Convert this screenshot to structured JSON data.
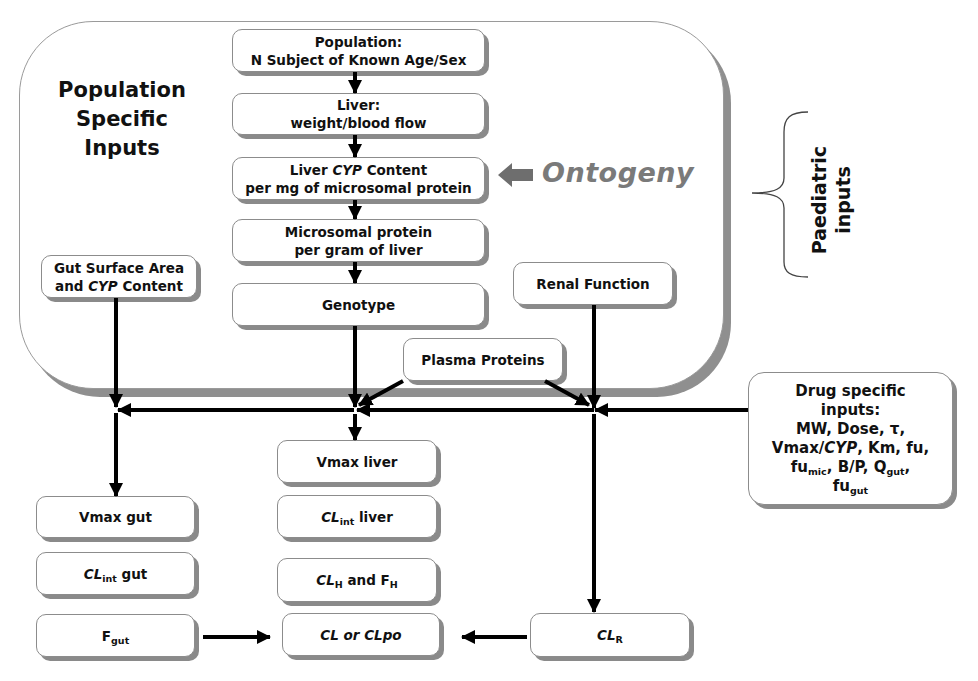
{
  "colors": {
    "box_border": "#8c8c8c",
    "box_shadow": "#8a8a8a",
    "arrow": "#000000",
    "ontogeny_text": "#7a7a7a",
    "ontogeny_arrow": "#6e6e6e"
  },
  "population_group": {
    "title_lines": [
      "Population",
      "Specific",
      "Inputs"
    ]
  },
  "central_column": {
    "population": {
      "lines": [
        "Population:",
        "N Subject of Known Age/Sex"
      ]
    },
    "liver": {
      "lines": [
        "Liver:",
        "weight/blood flow"
      ]
    },
    "liver_cyp": {
      "pre": "Liver ",
      "cyp": "CYP",
      "post": " Content",
      "line2": "per mg of microsomal protein"
    },
    "microsomal": {
      "lines": [
        "Microsomal protein",
        "per gram of liver"
      ]
    },
    "genotype": {
      "label": "Genotype"
    }
  },
  "ontogeny": {
    "label": "Ontogeny"
  },
  "paediatric_inputs": {
    "lines": [
      "Paediatric",
      "inputs"
    ]
  },
  "gut_surface": {
    "line1": "Gut Surface Area",
    "pre": "and ",
    "cyp": "CYP",
    "post": " Content"
  },
  "renal_function": {
    "label": "Renal Function"
  },
  "plasma_proteins": {
    "label": "Plasma Proteins"
  },
  "drug_specific": {
    "line1": "Drug specific",
    "line2": "inputs:",
    "line3": "MW, Dose, τ,",
    "line4_pre": "Vmax/",
    "line4_cyp": "CYP",
    "line4_post": ", Km, fu,",
    "line5_a": "fu",
    "line5_sub1": "mic",
    "line5_b": ", B/P, Q",
    "line5_sub2": "gut",
    "line5_c": ",",
    "line6_a": "fu",
    "line6_sub": "gut"
  },
  "outputs": {
    "vmax_gut": {
      "label": "Vmax gut"
    },
    "clint_gut": {
      "base": "CL",
      "sub": "int",
      "rest": " gut"
    },
    "f_gut": {
      "base": "F",
      "sub": "gut"
    },
    "vmax_liver": {
      "label": "Vmax liver"
    },
    "clint_liver": {
      "base": "CL",
      "sub": "int",
      "rest": " liver"
    },
    "clh_fh": {
      "base1": "CL",
      "sub1": "H",
      "mid": " and F",
      "sub2": "H"
    },
    "cl_clpo": {
      "label": "CL or CLpo"
    },
    "cl_r": {
      "base": "CL",
      "sub": "R"
    }
  }
}
